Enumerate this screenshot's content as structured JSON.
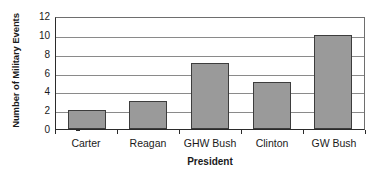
{
  "chart_data": {
    "type": "bar",
    "title": "",
    "categories": [
      "Carter",
      "Reagan",
      "GHW Bush",
      "Clinton",
      "GW Bush"
    ],
    "values": [
      2,
      3,
      7,
      5,
      10
    ],
    "xlabel": "President",
    "ylabel": "Number of Military Events",
    "ylim": [
      0,
      12
    ],
    "y_ticks": [
      0,
      2,
      4,
      6,
      8,
      10,
      12
    ],
    "y_tick_labels": [
      "0",
      "2",
      "4",
      "6",
      "8",
      "10",
      "12"
    ],
    "grid": true,
    "legend": false,
    "colors": {
      "bar_fill": "#9a9a9a",
      "bar_edge": "#3d3d3d",
      "axis": "#2b2b2b",
      "gridline": "#8a8a8a",
      "background": "#ffffff"
    }
  }
}
